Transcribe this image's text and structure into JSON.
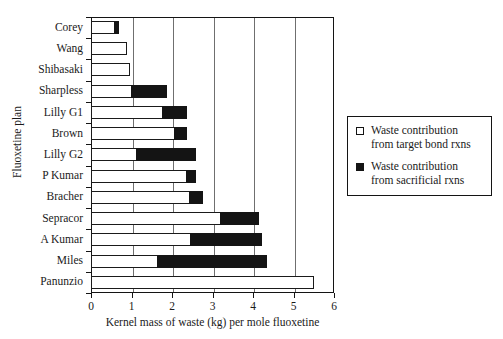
{
  "chart_data": {
    "type": "bar",
    "orientation": "horizontal",
    "stacked": true,
    "title": "",
    "xlabel": "Kernel mass of waste (kg) per mole fluoxetine",
    "ylabel": "Fluoxetine plan",
    "xlim": [
      0,
      6
    ],
    "xticks": [
      "0",
      "1",
      "2",
      "3",
      "4",
      "5",
      "6"
    ],
    "grid": "vertical",
    "legend_position": "right",
    "categories": [
      "Corey",
      "Wang",
      "Shibasaki",
      "Sharpless",
      "Lilly G1",
      "Brown",
      "Lilly G2",
      "P Kumar",
      "Bracher",
      "Sepracor",
      "A Kumar",
      "Miles",
      "Panunzio"
    ],
    "series": [
      {
        "name": "Waste contribution from target bond rxns",
        "color": "#ffffff",
        "values": [
          0.6,
          0.9,
          0.97,
          1.0,
          1.78,
          2.08,
          1.14,
          2.37,
          2.45,
          3.2,
          2.48,
          1.65,
          5.5
        ]
      },
      {
        "name": "Waste contribution from sacrificial rxns",
        "color": "#141414",
        "values": [
          0.08,
          0.0,
          0.0,
          0.88,
          0.59,
          0.29,
          1.46,
          0.23,
          0.32,
          0.95,
          1.75,
          2.7,
          0.0
        ]
      }
    ],
    "totals": [
      0.68,
      0.9,
      0.97,
      1.88,
      2.37,
      2.37,
      2.6,
      2.6,
      2.77,
      4.15,
      4.23,
      4.35,
      5.5
    ]
  },
  "legend": {
    "entries": [
      {
        "marker": "open-square",
        "label": "Waste contribution from target bond rxns"
      },
      {
        "marker": "filled-square",
        "label": "Waste contribution from sacrificial rxns"
      }
    ]
  }
}
